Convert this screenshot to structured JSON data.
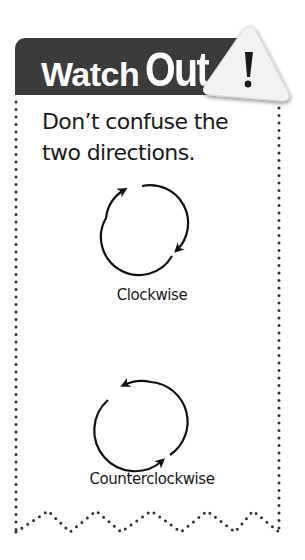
{
  "callout": {
    "title_part1": "Watch",
    "title_part2": "Out",
    "warning_glyph": "!",
    "message": "Don’t confuse the two directions.",
    "colors": {
      "header": "#3b3b3b",
      "border_dots": "#333333",
      "triangle": "#f2f2f2"
    }
  },
  "diagrams": [
    {
      "label": "Clockwise",
      "icon": "clockwise-arrow-icon"
    },
    {
      "label": "Counterclockwise",
      "icon": "counterclockwise-arrow-icon"
    }
  ]
}
